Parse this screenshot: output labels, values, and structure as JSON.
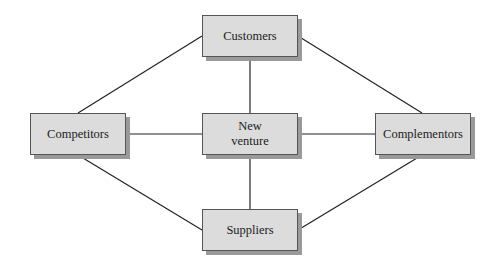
{
  "diagram": {
    "nodes": {
      "customers": {
        "label": "Customers"
      },
      "competitors": {
        "label": "Competitors"
      },
      "new_venture": {
        "label": "New\nventure",
        "line1": "New",
        "line2": "venture"
      },
      "complementors": {
        "label": "Complementors"
      },
      "suppliers": {
        "label": "Suppliers"
      }
    },
    "edges": [
      [
        "customers",
        "new_venture"
      ],
      [
        "new_venture",
        "suppliers"
      ],
      [
        "competitors",
        "new_venture"
      ],
      [
        "new_venture",
        "complementors"
      ],
      [
        "customers",
        "competitors"
      ],
      [
        "customers",
        "complementors"
      ],
      [
        "suppliers",
        "competitors"
      ],
      [
        "suppliers",
        "complementors"
      ]
    ],
    "colors": {
      "box_fill": "#dcdcdc",
      "box_border": "#555555",
      "shadow": "#9a9a9a",
      "line": "#222222"
    }
  }
}
